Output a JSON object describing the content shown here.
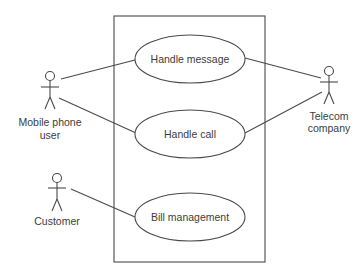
{
  "diagram": {
    "type": "uml-use-case",
    "colors": {
      "line": "#4a4a4a",
      "text": "#3c3c3c",
      "background": "#ffffff"
    },
    "system_boundary": {
      "x": 114,
      "y": 16,
      "width": 151,
      "height": 246
    },
    "use_cases": [
      {
        "id": "uc1",
        "label": "Handle message",
        "cx": 190,
        "cy": 59,
        "rx": 55,
        "ry": 24
      },
      {
        "id": "uc2",
        "label": "Handle call",
        "cx": 190,
        "cy": 134,
        "rx": 55,
        "ry": 24
      },
      {
        "id": "uc3",
        "label": "Bill management",
        "cx": 190,
        "cy": 217,
        "rx": 55,
        "ry": 24
      }
    ],
    "actors": [
      {
        "id": "a1",
        "label_line1": "Mobile phone",
        "label_line2": "user",
        "x": 50,
        "y": 75
      },
      {
        "id": "a2",
        "label_line1": "Telecom",
        "label_line2": "company",
        "x": 329,
        "y": 71
      },
      {
        "id": "a3",
        "label_line1": "Customer",
        "label_line2": "",
        "x": 57,
        "y": 178
      }
    ],
    "associations": [
      {
        "from": "Mobile phone user",
        "to": "Handle message"
      },
      {
        "from": "Mobile phone user",
        "to": "Handle call"
      },
      {
        "from": "Telecom company",
        "to": "Handle message"
      },
      {
        "from": "Telecom company",
        "to": "Handle call"
      },
      {
        "from": "Customer",
        "to": "Bill management"
      }
    ]
  }
}
